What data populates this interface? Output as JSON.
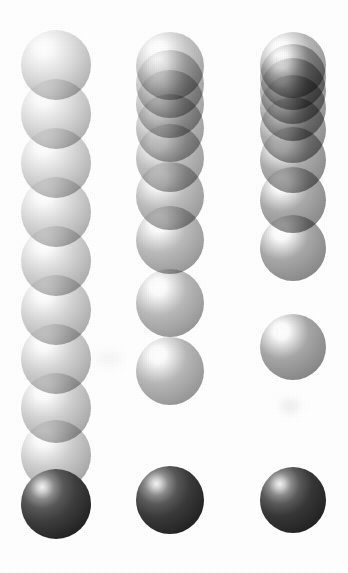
{
  "figure": {
    "background_color": "#ffffff",
    "width": 348,
    "height": 573,
    "sphere_diameter": 70,
    "highlight_color": "#ffffff",
    "terminal_sphere_color": "#2e2e2e",
    "column_centers_x": [
      56,
      170,
      293
    ]
  },
  "chart_data": {
    "type": "scatter",
    "xlabel": "",
    "ylabel": "",
    "grid": false,
    "legend": "none",
    "xlim": [
      0,
      348
    ],
    "ylim": [
      573,
      0
    ],
    "marker": "sphere",
    "series": [
      {
        "name": "column-1",
        "center_x": 56,
        "sphere_diameter": 70,
        "count": 10,
        "base_gray": "#d9d9d9",
        "terminal_gray": "#3a3a3a",
        "y_centers": [
          65,
          114,
          163,
          212,
          261,
          310,
          359,
          408,
          457,
          504
        ],
        "gaps": [
          49,
          49,
          49,
          49,
          49,
          49,
          49,
          49,
          47
        ],
        "terminal_index": 9
      },
      {
        "name": "column-2",
        "center_x": 170,
        "sphere_diameter": 68,
        "count": 9,
        "base_gray": "#c4c4c4",
        "terminal_gray": "#3a3a3a",
        "y_centers": [
          66,
          84,
          104,
          128,
          158,
          196,
          240,
          300,
          368
        ],
        "gaps": [
          18,
          20,
          24,
          30,
          38,
          44,
          60,
          68
        ],
        "terminal_index": 8,
        "terminal_y_center": 500
      },
      {
        "name": "column-3",
        "center_x": 293,
        "sphere_diameter": 66,
        "count": 9,
        "base_gray": "#b0b0b0",
        "terminal_gray": "#343434",
        "y_centers": [
          65,
          77,
          91,
          108,
          130,
          160,
          200,
          248,
          347
        ],
        "gaps": [
          12,
          14,
          17,
          22,
          30,
          40,
          48,
          99
        ],
        "terminal_index": 8,
        "terminal_y_center": 500
      }
    ]
  },
  "columns": [
    {
      "id": "column-1",
      "label": "column-1",
      "center_x": 56,
      "diameter": 70,
      "spheres": [
        {
          "y": 65,
          "gray": "#dedede",
          "terminal": false
        },
        {
          "y": 114,
          "gray": "#dcdcdc",
          "terminal": false
        },
        {
          "y": 163,
          "gray": "#dadada",
          "terminal": false
        },
        {
          "y": 212,
          "gray": "#d8d8d8",
          "terminal": false
        },
        {
          "y": 261,
          "gray": "#d6d6d6",
          "terminal": false
        },
        {
          "y": 310,
          "gray": "#d4d4d4",
          "terminal": false
        },
        {
          "y": 359,
          "gray": "#d2d2d2",
          "terminal": false
        },
        {
          "y": 408,
          "gray": "#d0d0d0",
          "terminal": false
        },
        {
          "y": 455,
          "gray": "#cecece",
          "terminal": false
        },
        {
          "y": 504,
          "gray": "#3d3d3d",
          "terminal": true
        }
      ]
    },
    {
      "id": "column-2",
      "label": "column-2",
      "center_x": 170,
      "diameter": 68,
      "spheres": [
        {
          "y": 66,
          "gray": "#c8c8c8",
          "terminal": false
        },
        {
          "y": 84,
          "gray": "#c6c6c6",
          "terminal": false
        },
        {
          "y": 104,
          "gray": "#c4c4c4",
          "terminal": false
        },
        {
          "y": 128,
          "gray": "#c2c2c2",
          "terminal": false
        },
        {
          "y": 158,
          "gray": "#c0c0c0",
          "terminal": false
        },
        {
          "y": 196,
          "gray": "#bebebe",
          "terminal": false
        },
        {
          "y": 240,
          "gray": "#bcbcbc",
          "terminal": false
        },
        {
          "y": 303,
          "gray": "#bababa",
          "terminal": false
        },
        {
          "y": 371,
          "gray": "#b8b8b8",
          "terminal": false
        },
        {
          "y": 500,
          "gray": "#3a3a3a",
          "terminal": true
        }
      ]
    },
    {
      "id": "column-3",
      "label": "column-3",
      "center_x": 293,
      "diameter": 66,
      "spheres": [
        {
          "y": 65,
          "gray": "#b6b6b6",
          "terminal": false
        },
        {
          "y": 77,
          "gray": "#b4b4b4",
          "terminal": false
        },
        {
          "y": 91,
          "gray": "#b2b2b2",
          "terminal": false
        },
        {
          "y": 108,
          "gray": "#b0b0b0",
          "terminal": false
        },
        {
          "y": 130,
          "gray": "#aeaeae",
          "terminal": false
        },
        {
          "y": 160,
          "gray": "#acacac",
          "terminal": false
        },
        {
          "y": 200,
          "gray": "#aaaaaa",
          "terminal": false
        },
        {
          "y": 248,
          "gray": "#a8a8a8",
          "terminal": false
        },
        {
          "y": 347,
          "gray": "#a6a6a6",
          "terminal": false
        },
        {
          "y": 500,
          "gray": "#363636",
          "terminal": true
        }
      ]
    }
  ]
}
